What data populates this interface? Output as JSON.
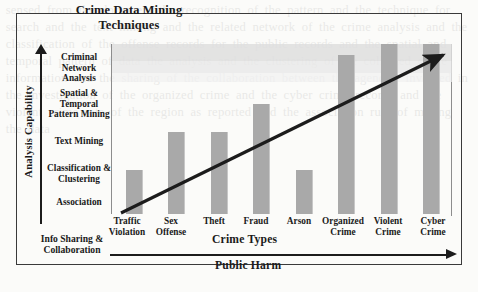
{
  "figure": {
    "title": "Crime Data Mining\nTechniques",
    "title_line1": "Crime Data Mining",
    "title_line2": "Techniques",
    "axis_y_title": "Analysis Capability",
    "axis_x_title": "Crime Types",
    "axis_x_secondary_title": "Public Harm",
    "corner_label_line1": "Info Sharing &",
    "corner_label_line2": "Collaboration",
    "bar_color": "#a9a9a9",
    "line_color": "#1c1c1c",
    "frame_color": "#3a3a3a"
  },
  "chart_data": {
    "type": "bar",
    "title": "Crime Data Mining Techniques",
    "xlabel": "Crime Types",
    "xlabel_secondary": "Public Harm",
    "ylabel": "Analysis Capability",
    "grid": false,
    "legend": "none",
    "ylim": [
      0,
      6
    ],
    "ytick_labels": [
      "Association",
      "Classification &\nClustering",
      "Text Mining",
      "Spatial &\nTemporal\nPattern Mining",
      "Criminal\nNetwork Analysis"
    ],
    "ytick_values": [
      1,
      2,
      3,
      4,
      5
    ],
    "categories": [
      "Traffic\nViolation",
      "Sex\nOffense",
      "Theft",
      "Fraud",
      "Arson",
      "Organized\nCrime",
      "Violent\nCrime",
      "Cyber\nCrime"
    ],
    "values": [
      1.55,
      2.9,
      2.9,
      3.9,
      1.55,
      5.6,
      6.0,
      6.0
    ],
    "annotations": [
      {
        "type": "arrow",
        "label": "capability-vs-harm-trend",
        "from": [
          0.1,
          0.05
        ],
        "to": [
          7.6,
          5.9
        ]
      }
    ]
  },
  "ytick_lines": [
    [
      "Criminal",
      "Network Analysis"
    ],
    [
      "Spatial &",
      "Temporal",
      "Pattern Mining"
    ],
    [
      "Text Mining"
    ],
    [
      "Classification &",
      "Clustering"
    ],
    [
      "Association"
    ]
  ],
  "xtick_lines": [
    [
      "Traffic",
      "Violation"
    ],
    [
      "Sex",
      "Offense"
    ],
    [
      "Theft"
    ],
    [
      "Fraud"
    ],
    [
      "Arson"
    ],
    [
      "Organized",
      "Crime"
    ],
    [
      "Violent",
      "Crime"
    ],
    [
      "Cyber",
      "Crime"
    ]
  ],
  "bleed_text": "sensed from the document the recognition of the pattern and the technique for search and the text mining and the related network of the crime analysis and the classification of the offense records for the public records and the spatial and temporal pattern of data the analysis and the clustering of the collected crime information and the sharing of the collaboration between the agencies involved in the investigation of the organized crime and the cyber crime records and the violent crime rate of the region as reported and the association rule of mining the data"
}
